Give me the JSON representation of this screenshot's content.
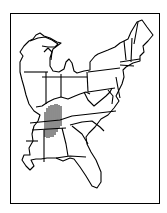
{
  "map": {
    "region": "Eastern United States",
    "style": "black line outline map, state borders",
    "highlight": {
      "pattern": "vertical hatching",
      "area": "Tennessee / northern Alabama / southern Kentucky",
      "color": "#000000"
    },
    "colors": {
      "line": "#000000",
      "background": "#ffffff"
    }
  }
}
